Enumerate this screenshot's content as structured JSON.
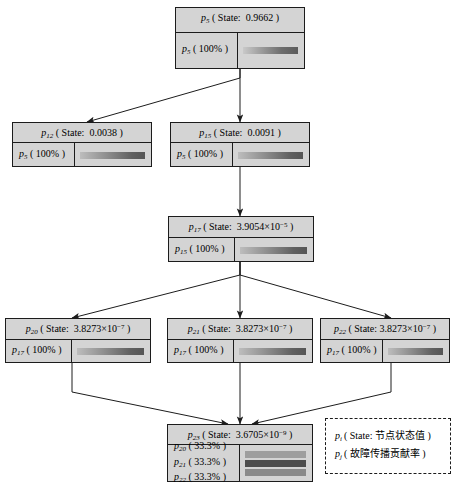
{
  "diagram": {
    "nodes": [
      {
        "id": "n5",
        "head": "p5 ( State: 0.9662 )",
        "head_var": "p",
        "head_sub": "5",
        "head_state_label": "State",
        "head_state_value": "0.9662",
        "contributions": [
          {
            "var": "p",
            "sub": "5",
            "label": "p5 ( 100% )",
            "percent": "100%",
            "bar_style": "bar-g1"
          }
        ]
      },
      {
        "id": "n12",
        "head": "p12 ( State: 0.0038 )",
        "head_var": "p",
        "head_sub": "12",
        "head_state_label": "State",
        "head_state_value": "0.0038",
        "contributions": [
          {
            "var": "p",
            "sub": "5",
            "label": "p5 ( 100% )",
            "percent": "100%",
            "bar_style": "bar-g2"
          }
        ]
      },
      {
        "id": "n15",
        "head": "p15 ( State: 0.0091 )",
        "head_var": "p",
        "head_sub": "15",
        "head_state_label": "State",
        "head_state_value": "0.0091",
        "contributions": [
          {
            "var": "p",
            "sub": "5",
            "label": "p5 ( 100% )",
            "percent": "100%",
            "bar_style": "bar-g2"
          }
        ]
      },
      {
        "id": "n17",
        "head": "p17 ( State: 3.9054×10-5 )",
        "head_var": "p",
        "head_sub": "17",
        "head_state_label": "State",
        "head_state_value": "3.9054×10",
        "head_state_exp": "−5",
        "contributions": [
          {
            "var": "p",
            "sub": "15",
            "label": "p15 ( 100% )",
            "percent": "100%",
            "bar_style": "bar-g2"
          }
        ]
      },
      {
        "id": "n20",
        "head": "p20 ( State: 3.8273×10-7 )",
        "head_var": "p",
        "head_sub": "20",
        "head_state_label": "State",
        "head_state_value": "3.8273×10",
        "head_state_exp": "−7",
        "contributions": [
          {
            "var": "p",
            "sub": "17",
            "label": "p17 ( 100% )",
            "percent": "100%",
            "bar_style": "bar-g2"
          }
        ]
      },
      {
        "id": "n21",
        "head": "p21 ( State: 3.8273×10-7 )",
        "head_var": "p",
        "head_sub": "21",
        "head_state_label": "State",
        "head_state_value": "3.8273×10",
        "head_state_exp": "−7",
        "contributions": [
          {
            "var": "p",
            "sub": "17",
            "label": "p17 ( 100% )",
            "percent": "100%",
            "bar_style": "bar-g2"
          }
        ]
      },
      {
        "id": "n22",
        "head": "p22 ( State: 3.8273×10-7 )",
        "head_var": "p",
        "head_sub": "22",
        "head_state_label": "State",
        "head_state_value": "3.8273×10",
        "head_state_exp": "−7",
        "contributions": [
          {
            "var": "p",
            "sub": "17",
            "label": "p17 ( 100% )",
            "percent": "100%",
            "bar_style": "bar-g2"
          }
        ]
      },
      {
        "id": "n23",
        "head": "p23 ( State: 3.6705×10-9 )",
        "head_var": "p",
        "head_sub": "23",
        "head_state_label": "State",
        "head_state_value": "3.6705×10",
        "head_state_exp": "−9",
        "contributions": [
          {
            "var": "p",
            "sub": "20",
            "label": "p20 ( 33.3% )",
            "percent": "33.3%",
            "bar_style": "bar-solid-light"
          },
          {
            "var": "p",
            "sub": "21",
            "label": "p21 ( 33.3% )",
            "percent": "33.3%",
            "bar_style": "bar-solid-dark"
          },
          {
            "var": "p",
            "sub": "22",
            "label": "p22 ( 33.3% )",
            "percent": "33.3%",
            "bar_style": "bar-solid-mid"
          }
        ]
      }
    ],
    "edges": [
      {
        "from": "n5",
        "to": "n12"
      },
      {
        "from": "n5",
        "to": "n15"
      },
      {
        "from": "n15",
        "to": "n17"
      },
      {
        "from": "n17",
        "to": "n20"
      },
      {
        "from": "n17",
        "to": "n21"
      },
      {
        "from": "n17",
        "to": "n22"
      },
      {
        "from": "n20",
        "to": "n23"
      },
      {
        "from": "n21",
        "to": "n23"
      },
      {
        "from": "n22",
        "to": "n23"
      }
    ]
  },
  "legend": {
    "line1_prefix": "p",
    "line1_sub": "i",
    "line1_text": "( State: 节点状态值 )",
    "line2_prefix": "p",
    "line2_sub": "j",
    "line2_text": "( 故障传播贡献率 )"
  },
  "colors": {
    "box_fill": "#d4d4d4",
    "box_border": "#1c1c1c",
    "legend_bg": "#ffffff",
    "edge": "#1c1c1c",
    "bar_dark": "#4d4d4d",
    "bar_light": "#9e9e9e"
  }
}
